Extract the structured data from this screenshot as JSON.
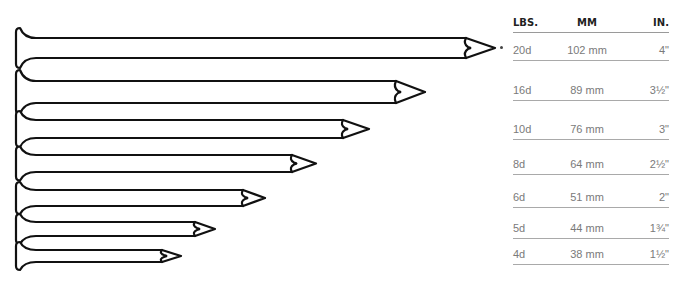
{
  "table": {
    "headers": {
      "lbs": "LBS.",
      "mm": "MM",
      "in": "IN."
    },
    "rows": [
      {
        "lbs": "20d",
        "mm": "102 mm",
        "in": "4\""
      },
      {
        "lbs": "16d",
        "mm": "89 mm",
        "in": "3½\""
      },
      {
        "lbs": "10d",
        "mm": "76 mm",
        "in": "3\""
      },
      {
        "lbs": "8d",
        "mm": "64 mm",
        "in": "2½\""
      },
      {
        "lbs": "6d",
        "mm": "51 mm",
        "in": "2\""
      },
      {
        "lbs": "5d",
        "mm": "44 mm",
        "in": "1¾\""
      },
      {
        "lbs": "4d",
        "mm": "38 mm",
        "in": "1½\""
      }
    ]
  },
  "nails": [
    {
      "size": "20d",
      "top": 38,
      "bottom": 58,
      "notch": 466,
      "tip": 495
    },
    {
      "size": "16d",
      "top": 81,
      "bottom": 103,
      "notch": 396,
      "tip": 425
    },
    {
      "size": "10d",
      "top": 120,
      "bottom": 138,
      "notch": 343,
      "tip": 369
    },
    {
      "size": "8d",
      "top": 155,
      "bottom": 172,
      "notch": 292,
      "tip": 316
    },
    {
      "size": "6d",
      "top": 190,
      "bottom": 206,
      "notch": 243,
      "tip": 265
    },
    {
      "size": "5d",
      "top": 222,
      "bottom": 236,
      "notch": 195,
      "tip": 215
    },
    {
      "size": "4d",
      "top": 250,
      "bottom": 262,
      "notch": 162,
      "tip": 181
    }
  ],
  "colors": {
    "stroke": "#111111",
    "table_text": "#7a7a7a",
    "header_text": "#222222",
    "rule": "#a9a9a9"
  }
}
